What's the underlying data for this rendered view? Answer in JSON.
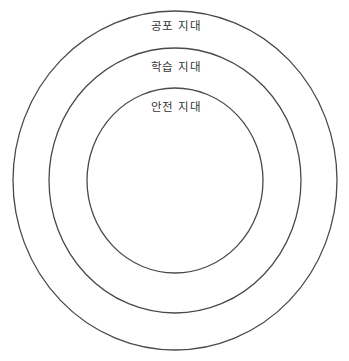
{
  "diagram": {
    "type": "concentric-zones",
    "background": "#ffffff",
    "stroke_color": "#4a4a4a",
    "text_color": "#333333",
    "zones": [
      {
        "label": "공포 지대",
        "cx": 175,
        "cy": 180.5,
        "rx": 162,
        "ry": 169.5,
        "label_x": 176,
        "label_y": 21
      },
      {
        "label": "학습 지대",
        "cx": 175,
        "cy": 180.5,
        "rx": 126,
        "ry": 132.5,
        "label_x": 176,
        "label_y": 62
      },
      {
        "label": "안전 지대",
        "cx": 175,
        "cy": 180.5,
        "rx": 88,
        "ry": 92.5,
        "label_x": 176,
        "label_y": 102
      }
    ]
  }
}
